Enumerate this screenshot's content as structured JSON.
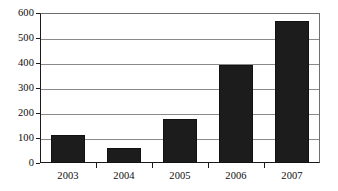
{
  "chart_data": {
    "type": "bar",
    "title": "",
    "subtitle": "",
    "xlabel": "",
    "ylabel": "",
    "categories": [
      "2003",
      "2004",
      "2005",
      "2006",
      "2007"
    ],
    "values": [
      112,
      60,
      175,
      393,
      568
    ],
    "series": [
      {
        "name": "",
        "values": [
          112,
          60,
          175,
          393,
          568
        ]
      }
    ],
    "ylim": [
      0,
      600
    ],
    "ytick_labels": [
      "0",
      "100",
      "200",
      "300",
      "400",
      "500",
      "600"
    ],
    "ytick_values": [
      0,
      100,
      200,
      300,
      400,
      500,
      600
    ],
    "grid": true,
    "grid_axis": "y",
    "legend": false,
    "legend_position": "none",
    "annotations": [],
    "colors": {
      "bar": "#1c1c1c",
      "background": "#ffffff",
      "gridline": "#8a8a8a",
      "axis": "#1a1a1a",
      "text": "#0d0d0d"
    }
  }
}
